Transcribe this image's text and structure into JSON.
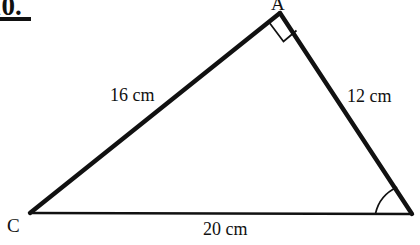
{
  "question": {
    "number": "10.",
    "underline": true
  },
  "figure": {
    "type": "right-triangle",
    "vertices": [
      {
        "name": "A",
        "label": "A",
        "label_visible": true,
        "x": 280,
        "y": 13
      },
      {
        "name": "B",
        "label": "",
        "label_visible": false,
        "x": 412,
        "y": 214
      },
      {
        "name": "C",
        "label": "C",
        "label_visible": true,
        "x": 30,
        "y": 213
      }
    ],
    "sides": [
      {
        "name": "CA",
        "label": "16 cm",
        "length": 16,
        "unit": "cm"
      },
      {
        "name": "AB",
        "label": "12 cm",
        "length": 12,
        "unit": "cm"
      },
      {
        "name": "CB",
        "label": "20 cm",
        "length": 20,
        "unit": "cm"
      }
    ],
    "angle_markers": [
      {
        "at_vertex": "A",
        "kind": "right-angle-square",
        "degrees": 90
      },
      {
        "at_vertex": "B",
        "kind": "arc",
        "degrees": null
      }
    ],
    "stroke_color": "#111111",
    "background_color": "#ffffff"
  }
}
